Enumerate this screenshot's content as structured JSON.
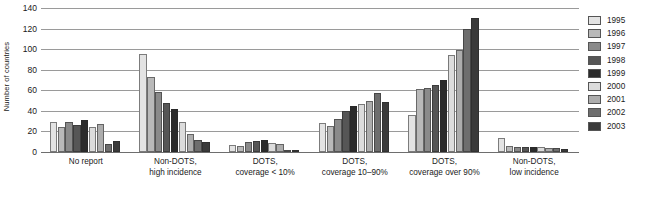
{
  "chart_data": {
    "type": "bar",
    "title": "",
    "subtitle": "",
    "xlabel": "",
    "ylabel": "Number of countries",
    "ylim": [
      0,
      140
    ],
    "yticks": [
      0,
      20,
      40,
      60,
      80,
      100,
      120,
      140
    ],
    "grid": true,
    "grid_axis": "y",
    "legend_position": "right",
    "legend_title": "",
    "categories": [
      "No report",
      "Non-DOTS, high incidence",
      "DOTS, coverage < 10%",
      "DOTS, coverage 10–90%",
      "DOTS, coverage over 90%",
      "Non-DOTS, low incidence"
    ],
    "category_lines": [
      [
        "No report",
        ""
      ],
      [
        "Non-DOTS,",
        "high incidence"
      ],
      [
        "DOTS,",
        "coverage < 10%"
      ],
      [
        "DOTS,",
        "coverage 10–90%"
      ],
      [
        "DOTS,",
        "coverage over 90%"
      ],
      [
        "Non-DOTS,",
        "low incidence"
      ]
    ],
    "series": [
      {
        "name": "1995",
        "color": "#e3e3e3",
        "values": [
          29,
          95,
          7,
          28,
          36,
          14
        ]
      },
      {
        "name": "1996",
        "color": "#b9b9b9",
        "values": [
          24,
          73,
          6,
          25,
          61,
          6
        ]
      },
      {
        "name": "1997",
        "color": "#8a8a8a",
        "values": [
          29,
          58,
          10,
          32,
          62,
          5
        ]
      },
      {
        "name": "1998",
        "color": "#565656",
        "values": [
          26,
          48,
          11,
          40,
          65,
          5
        ]
      },
      {
        "name": "1999",
        "color": "#2b2b2b",
        "values": [
          31,
          42,
          12,
          45,
          70,
          5
        ]
      },
      {
        "name": "2000",
        "color": "#dcdcdc",
        "values": [
          24,
          29,
          9,
          47,
          94,
          5
        ]
      },
      {
        "name": "2001",
        "color": "#adadad",
        "values": [
          27,
          18,
          8,
          50,
          99,
          4
        ]
      },
      {
        "name": "2002",
        "color": "#6e6e6e",
        "values": [
          8,
          12,
          2,
          57,
          120,
          4
        ]
      },
      {
        "name": "2003",
        "color": "#3a3a3a",
        "values": [
          11,
          10,
          1,
          49,
          130,
          3
        ]
      }
    ]
  },
  "legend": {
    "entries": [
      {
        "label": "1995"
      },
      {
        "label": "1996"
      },
      {
        "label": "1997"
      },
      {
        "label": "1998"
      },
      {
        "label": "1999"
      },
      {
        "label": "2000"
      },
      {
        "label": "2001"
      },
      {
        "label": "2002"
      },
      {
        "label": "2003"
      }
    ]
  }
}
